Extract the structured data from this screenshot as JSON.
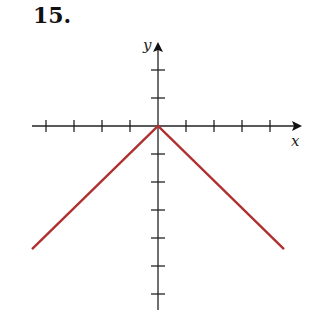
{
  "problem_number": "15.",
  "chart_data": {
    "type": "line",
    "title": "",
    "xlabel": "x",
    "ylabel": "y",
    "grid": false,
    "tick_spacing_units": 1,
    "xlim": [
      -4.6,
      5
    ],
    "ylim": [
      -6.5,
      3
    ],
    "x_ticks": [
      -4,
      -3,
      -2,
      -1,
      1,
      2,
      3,
      4
    ],
    "y_ticks": [
      2,
      1,
      -1,
      -2,
      -3,
      -4,
      -5,
      -6
    ],
    "series": [
      {
        "name": "y = -|x|",
        "color": "#b03030",
        "x": [
          -4.5,
          0,
          4.5
        ],
        "y": [
          -4.4,
          0,
          -4.4
        ]
      }
    ]
  },
  "colors": {
    "axis": "#222222",
    "curve": "#b03030"
  }
}
